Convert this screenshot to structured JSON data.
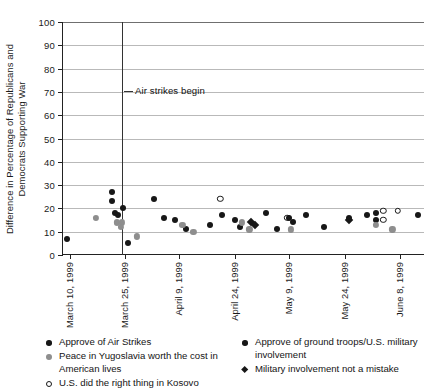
{
  "chart_data": {
    "type": "scatter",
    "title": "",
    "xlabel": "",
    "ylabel": "Difference in Percentage of Republicans and Democrats Supporting War",
    "ylim": [
      0,
      100
    ],
    "yticks": [
      0,
      10,
      20,
      30,
      40,
      50,
      60,
      70,
      80,
      90,
      100
    ],
    "xticks": [
      "March 10, 1999",
      "March 25, 1999",
      "April 9, 1999",
      "April 24, 1999",
      "May 9, 1999",
      "May 24, 1999",
      "June 8, 1999"
    ],
    "grid": "horizontal",
    "legend_position": "bottom",
    "annotations": [
      {
        "text": "Air strikes begin",
        "x": "March 24, 1999",
        "note": "vertical reference line"
      }
    ],
    "series": [
      {
        "name": "Approve of Air Strikes",
        "marker": "filled",
        "points": [
          {
            "x": 1.0,
            "y": 7
          },
          {
            "x": 13.5,
            "y": 27
          },
          {
            "x": 13.5,
            "y": 23
          },
          {
            "x": 14.5,
            "y": 18
          },
          {
            "x": 16.5,
            "y": 20
          },
          {
            "x": 15.2,
            "y": 17
          },
          {
            "x": 18.0,
            "y": 5
          },
          {
            "x": 25.0,
            "y": 24
          },
          {
            "x": 28.0,
            "y": 16
          },
          {
            "x": 31.0,
            "y": 15
          },
          {
            "x": 34.0,
            "y": 11
          },
          {
            "x": 40.5,
            "y": 13
          },
          {
            "x": 44.0,
            "y": 17
          },
          {
            "x": 47.5,
            "y": 15
          },
          {
            "x": 49.0,
            "y": 12
          },
          {
            "x": 56.0,
            "y": 18
          },
          {
            "x": 59.0,
            "y": 11
          },
          {
            "x": 67.0,
            "y": 17
          },
          {
            "x": 72.0,
            "y": 12
          },
          {
            "x": 79.0,
            "y": 16
          },
          {
            "x": 84.0,
            "y": 17
          },
          {
            "x": 86.5,
            "y": 18
          },
          {
            "x": 86.5,
            "y": 15
          },
          {
            "x": 98.0,
            "y": 17
          }
        ]
      },
      {
        "name": "Peace in Yugoslavia worth the cost in American lives",
        "marker": "grey",
        "points": [
          {
            "x": 9.0,
            "y": 16
          },
          {
            "x": 15.0,
            "y": 14
          },
          {
            "x": 16.2,
            "y": 14
          },
          {
            "x": 16.0,
            "y": 12
          },
          {
            "x": 20.5,
            "y": 8
          },
          {
            "x": 33.0,
            "y": 13
          },
          {
            "x": 36.0,
            "y": 10
          },
          {
            "x": 49.5,
            "y": 14
          },
          {
            "x": 51.5,
            "y": 11
          },
          {
            "x": 63.0,
            "y": 11
          },
          {
            "x": 86.5,
            "y": 13
          },
          {
            "x": 91.0,
            "y": 11
          }
        ]
      },
      {
        "name": "U.S. did the right thing in Kosovo",
        "marker": "open",
        "points": [
          {
            "x": 43.5,
            "y": 24
          },
          {
            "x": 62.0,
            "y": 16
          },
          {
            "x": 88.5,
            "y": 15
          },
          {
            "x": 88.5,
            "y": 19
          },
          {
            "x": 92.5,
            "y": 19
          }
        ]
      },
      {
        "name": "Approve of ground troops/U.S. military involvement",
        "marker": "filled",
        "points": [
          {
            "x": 62.5,
            "y": 16
          },
          {
            "x": 63.5,
            "y": 14
          }
        ]
      },
      {
        "name": "Military involvement not a mistake",
        "marker": "diamond",
        "points": [
          {
            "x": 52.0,
            "y": 14
          },
          {
            "x": 53.0,
            "y": 13
          },
          {
            "x": 79.0,
            "y": 15
          }
        ]
      }
    ]
  },
  "legend": {
    "left_items": [
      {
        "label": "Approve of Air Strikes",
        "marker": "filled"
      },
      {
        "label": "Peace in Yugoslavia worth the cost in American lives",
        "marker": "grey"
      },
      {
        "label": "U.S. did the right thing in Kosovo",
        "marker": "open"
      }
    ],
    "right_items": [
      {
        "label": "Approve of ground troops/U.S. military involvement",
        "marker": "filled"
      },
      {
        "label": "Military involvement not a mistake",
        "marker": "diamond"
      }
    ]
  }
}
